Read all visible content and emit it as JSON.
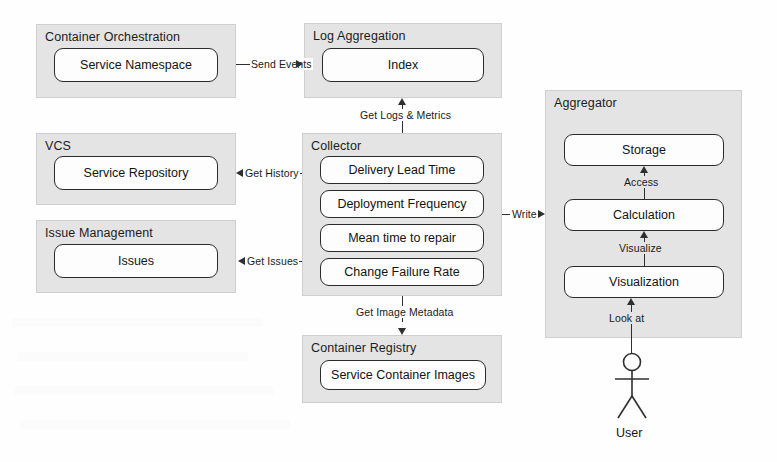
{
  "diagram": {
    "colors": {
      "group_fill": "#e4e4e4",
      "group_border": "#cfcfcf",
      "node_fill": "#fdfdfd",
      "node_border": "#2b2b2b",
      "line": "#2f2f2f",
      "text": "#141414",
      "background": "#fefefe"
    },
    "groups": [
      {
        "id": "container-orchestration",
        "title": "Container Orchestration",
        "nodes": [
          {
            "id": "service-namespace",
            "label": "Service Namespace"
          }
        ]
      },
      {
        "id": "log-aggregation",
        "title": "Log Aggregation",
        "nodes": [
          {
            "id": "index",
            "label": "Index"
          }
        ]
      },
      {
        "id": "vcs",
        "title": "VCS",
        "nodes": [
          {
            "id": "service-repository",
            "label": "Service Repository"
          }
        ]
      },
      {
        "id": "issue-management",
        "title": "Issue Management",
        "nodes": [
          {
            "id": "issues",
            "label": "Issues"
          }
        ]
      },
      {
        "id": "collector",
        "title": "Collector",
        "nodes": [
          {
            "id": "delivery-lead-time",
            "label": "Delivery Lead Time"
          },
          {
            "id": "deployment-frequency",
            "label": "Deployment Frequency"
          },
          {
            "id": "mean-time-to-repair",
            "label": "Mean time to repair"
          },
          {
            "id": "change-failure-rate",
            "label": "Change Failure Rate"
          }
        ]
      },
      {
        "id": "container-registry",
        "title": "Container Registry",
        "nodes": [
          {
            "id": "service-container-images",
            "label": "Service Container Images"
          }
        ]
      },
      {
        "id": "aggregator",
        "title": "Aggregator",
        "nodes": [
          {
            "id": "storage",
            "label": "Storage"
          },
          {
            "id": "calculation",
            "label": "Calculation"
          },
          {
            "id": "visualization",
            "label": "Visualization"
          }
        ]
      }
    ],
    "edges": [
      {
        "id": "send-events",
        "label": "Send Events",
        "from": "container-orchestration",
        "to": "log-aggregation",
        "direction": "right"
      },
      {
        "id": "get-logs-metrics",
        "label": "Get Logs & Metrics",
        "from": "collector",
        "to": "log-aggregation",
        "direction": "up"
      },
      {
        "id": "get-history",
        "label": "Get History",
        "from": "collector",
        "to": "vcs",
        "direction": "left"
      },
      {
        "id": "get-issues",
        "label": "Get Issues",
        "from": "collector",
        "to": "issue-management",
        "direction": "left"
      },
      {
        "id": "get-image-metadata",
        "label": "Get Image Metadata",
        "from": "collector",
        "to": "container-registry",
        "direction": "down"
      },
      {
        "id": "write",
        "label": "Write",
        "from": "collector",
        "to": "aggregator",
        "direction": "right"
      },
      {
        "id": "access",
        "label": "Access",
        "from": "calculation",
        "to": "storage",
        "direction": "up"
      },
      {
        "id": "visualize",
        "label": "Visualize",
        "from": "visualization",
        "to": "calculation",
        "direction": "up"
      },
      {
        "id": "look-at",
        "label": "Look at",
        "from": "user",
        "to": "visualization",
        "direction": "up"
      }
    ],
    "actors": [
      {
        "id": "user",
        "label": "User",
        "shape": "stick-figure"
      }
    ]
  }
}
